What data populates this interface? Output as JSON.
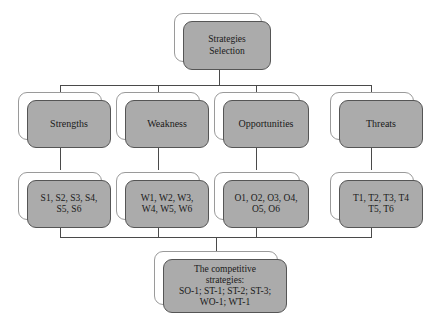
{
  "diagram": {
    "type": "flowchart",
    "title_node": {
      "id": "strategies-selection",
      "label": "Strategies\nSelection"
    },
    "categories": [
      {
        "id": "strengths",
        "label": "Strengths"
      },
      {
        "id": "weakness",
        "label": "Weakness"
      },
      {
        "id": "opportunities",
        "label": "Opportunities"
      },
      {
        "id": "threats",
        "label": "Threats"
      }
    ],
    "item_lists": [
      {
        "id": "strengths-items",
        "label": "S1, S2, S3, S4,\nS5, S6"
      },
      {
        "id": "weakness-items",
        "label": "W1, W2, W3,\nW4, W5, W6"
      },
      {
        "id": "opportunities-items",
        "label": "O1, O2, O3, O4,\nO5, O6"
      },
      {
        "id": "threats-items",
        "label": "T1, T2, T3, T4\nT5, T6"
      }
    ],
    "result_node": {
      "id": "competitive-strategies",
      "label": "The competitive\nstrategies:\nSO-1; ST-1; ST-2; ST-3;\nWO-1; WT-1"
    },
    "colors": {
      "node_fill": "#ababab",
      "node_border": "#555555",
      "shadow_fill": "#ffffff",
      "shadow_border": "#9a9a9a",
      "connector": "#4a4a4a",
      "background": "#ffffff",
      "text": "#1a1a1a"
    }
  }
}
